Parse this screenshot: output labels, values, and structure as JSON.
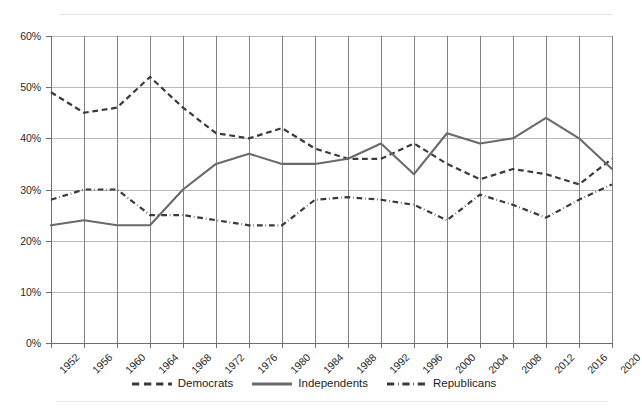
{
  "chart_data": {
    "type": "line",
    "title": "",
    "subtitle": "",
    "xlabel": "",
    "ylabel": "",
    "grid": true,
    "legend_position": "bottom",
    "ylim": [
      0,
      60
    ],
    "ytick_labels": [
      "60%",
      "50%",
      "40%",
      "30%",
      "20%",
      "10%",
      "0%"
    ],
    "ytick_values": [
      60,
      50,
      40,
      30,
      20,
      10,
      0
    ],
    "categories": [
      "1952",
      "1956",
      "1960",
      "1964",
      "1968",
      "1972",
      "1976",
      "1980",
      "1984",
      "1988",
      "1992",
      "1996",
      "2000",
      "2004",
      "2008",
      "2012",
      "2016",
      "2020"
    ],
    "series": [
      {
        "name": "Democrats",
        "style": "dashed",
        "color": "#3a3a3c",
        "values": [
          49,
          45,
          46,
          52,
          46,
          41,
          40,
          42,
          38,
          36,
          36,
          39,
          35,
          32,
          34,
          33,
          31,
          36
        ]
      },
      {
        "name": "Independents",
        "style": "solid",
        "color": "#6a6a6e",
        "values": [
          23,
          24,
          23,
          23,
          30,
          35,
          37,
          35,
          35,
          36,
          39,
          33,
          41,
          39,
          40,
          44,
          40,
          34
        ]
      },
      {
        "name": "Republicans",
        "style": "dash-dot",
        "color": "#3a3a3c",
        "values": [
          28,
          30,
          30,
          25,
          25,
          24,
          23,
          23,
          28,
          28.5,
          28,
          27,
          24,
          29,
          27,
          24.5,
          28,
          31
        ]
      }
    ]
  },
  "legend": {
    "items": [
      {
        "label": "Democrats",
        "style": "dashed"
      },
      {
        "label": "Independents",
        "style": "solid"
      },
      {
        "label": "Republicans",
        "style": "dash-dot"
      }
    ]
  },
  "colors": {
    "grid": "#b9b9bc",
    "vgrid": "#818185",
    "axis": "#6e6e72",
    "rule": "#e3e3e5",
    "text": "#231f20",
    "democrats": "#3a3a3c",
    "independents": "#6a6a6e",
    "republicans": "#3a3a3c"
  }
}
